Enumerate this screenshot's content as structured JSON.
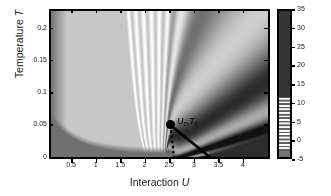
{
  "figure": {
    "axes": {
      "x_title_prefix": "Interaction ",
      "x_title_symbol": "U",
      "y_title_prefix": "Temperature ",
      "y_title_symbol": "T"
    },
    "colorbar": {
      "title_plain_1": "log",
      "title_sub": "10",
      "title_rho": "ρ",
      "title_plain_2": "(U,T)",
      "ticks": [
        -5,
        0,
        5,
        10,
        15,
        20,
        25,
        30,
        35
      ],
      "tick_labels": [
        "-5",
        "0",
        "5",
        "10",
        "15",
        "20",
        "25",
        "30",
        "35"
      ],
      "vmin": -5,
      "vmax": 35
    },
    "annotations": {
      "critical_point_label": "U",
      "critical_point_label_sub1": "c",
      "critical_point_label_mid": ",T",
      "critical_point_label_sub2": "c",
      "critical_point_label_full": "Uₑ,Tₑ"
    },
    "colors": {
      "frame": "#000000",
      "low_value_dark": "#555555",
      "high_value_dark": "#2b2b2b",
      "mid_light": "#ffffff",
      "text": "#1a1a1a"
    }
  },
  "chart_data": {
    "type": "heatmap",
    "title": "",
    "subtitle": "",
    "xlabel": "Interaction U",
    "ylabel": "Temperature T",
    "zlabel": "log10 rho(U,T)",
    "grid": false,
    "legend_position": "right-colorbar",
    "xlim": [
      0.1,
      4.5
    ],
    "ylim": [
      0.0,
      0.225
    ],
    "zlim": [
      -5,
      35
    ],
    "xtick_values": [
      0.5,
      1,
      1.5,
      2,
      2.5,
      3,
      3.5,
      4
    ],
    "xtick_labels": [
      "0.5",
      "1",
      "1.5",
      "2",
      "2.5",
      "3",
      "3.5",
      "4"
    ],
    "ytick_values": [
      0,
      0.05,
      0.1,
      0.15,
      0.2
    ],
    "ytick_labels": [
      "0",
      "0.05",
      "0.1",
      "0.15",
      "0.2"
    ],
    "ztick_values": [
      -5,
      0,
      5,
      10,
      15,
      20,
      25,
      30,
      35
    ],
    "colormap": "grayscale_banded",
    "features": {
      "critical_point": {
        "U": 2.45,
        "T": 0.046
      },
      "first_order_line": [
        {
          "U": 2.45,
          "T": 0.046
        },
        {
          "U": 2.85,
          "T": 0.018
        },
        {
          "U": 3.3,
          "T": 0.0
        }
      ],
      "crossover_dotted_line": [
        {
          "U": 2.45,
          "T": 0.046
        },
        {
          "U": 2.52,
          "T": 0.0
        }
      ],
      "insulator_wedge": [
        {
          "U": 3.3,
          "T": 0.0
        },
        {
          "U": 4.5,
          "T": 0.0
        },
        {
          "U": 4.5,
          "T": 0.032
        }
      ],
      "metal_region_dark_corner": [
        {
          "U": 0.1,
          "T": 0.0
        },
        {
          "U": 2.5,
          "T": 0.0
        },
        {
          "U": 0.1,
          "T": 0.075
        }
      ]
    },
    "contour_band_values": [
      -5,
      -3,
      -1,
      1,
      3,
      5,
      7,
      9,
      11,
      13,
      15,
      17,
      19,
      21,
      23,
      25,
      27,
      29,
      31,
      33,
      35
    ],
    "x_samples": [
      0.1,
      0.5,
      1.0,
      1.5,
      2.0,
      2.45,
      2.5,
      3.0,
      3.3,
      3.5,
      4.0,
      4.5
    ],
    "y_samples": [
      0.0,
      0.025,
      0.046,
      0.05,
      0.075,
      0.1,
      0.125,
      0.15,
      0.175,
      0.2,
      0.225
    ]
  }
}
